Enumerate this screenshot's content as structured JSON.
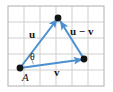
{
  "figure": {
    "type": "vector-diagram",
    "background_color": "#ffffff",
    "grid": {
      "visible": true,
      "line_color": "#c8c8c8",
      "border_color": "#b4b4b4",
      "cell_size_px": 16,
      "columns": 6,
      "rows": 5,
      "left_px": 8,
      "top_px": 6,
      "right_px": 104,
      "bottom_px": 86
    },
    "style": {
      "vector_color": "#4a8fd0",
      "point_color": "#141414",
      "text_color": "#141414",
      "vector_width_px": 2,
      "point_radius_px": 3.2
    },
    "points": [
      {
        "name": "A",
        "label": "A",
        "x": 20,
        "y": 68,
        "label_dx": 2,
        "label_dy": 5
      },
      {
        "name": "apex",
        "label": "",
        "x": 58,
        "y": 18,
        "label_dx": 0,
        "label_dy": 0
      },
      {
        "name": "right",
        "label": "",
        "x": 84,
        "y": 59,
        "label_dx": 0,
        "label_dy": 0
      }
    ],
    "vectors": [
      {
        "name": "u",
        "label": "u",
        "from": "A",
        "to": "apex",
        "x1": 20,
        "y1": 68,
        "x2": 58,
        "y2": 18,
        "label_x": 29,
        "label_y": 29
      },
      {
        "name": "v",
        "label": "v",
        "from": "A",
        "to": "right",
        "x1": 20,
        "y1": 68,
        "x2": 84,
        "y2": 59,
        "label_x": 54,
        "label_y": 67
      },
      {
        "name": "u-minus-v",
        "label": "u − v",
        "from": "right",
        "to": "apex",
        "x1": 84,
        "y1": 59,
        "x2": 60,
        "y2": 20,
        "label_x": 71,
        "label_y": 27
      }
    ],
    "angle": {
      "name": "theta",
      "label": "θ",
      "at_point": "A",
      "label_x": 30,
      "label_y": 52,
      "arc_radius_px": 15
    }
  }
}
